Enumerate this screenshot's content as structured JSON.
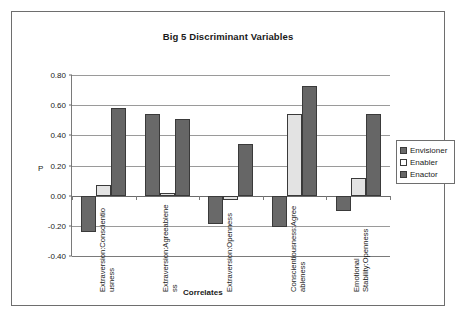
{
  "chart_data": {
    "type": "bar",
    "title": "Big 5 Discriminant Variables",
    "xlabel": "Correlates",
    "ylabel": "P",
    "ylim": [
      -0.4,
      0.8
    ],
    "ytick_step": 0.2,
    "ytick_labels": [
      "0.80",
      "0.60",
      "0.40",
      "0.20",
      "0.00",
      "-0.20",
      "-0.40"
    ],
    "ytick_values": [
      0.8,
      0.6,
      0.4,
      0.2,
      0.0,
      -0.2,
      -0.4
    ],
    "grid": true,
    "legend_position": "right",
    "categories": [
      "Extraversion:Conscientiousness",
      "Extraversion:Agreeableness",
      "Extraversion:Openness",
      "Conscientiousness:Agreeableness",
      "Emotional Stability:Openness"
    ],
    "category_label_lines": [
      [
        "Extraversion:Conscientio",
        "usness"
      ],
      [
        "Extraversion:Agreeablene",
        "ss"
      ],
      [
        "Extraversion:Openness"
      ],
      [
        "Conscientiousness:Agree",
        "ableness"
      ],
      [
        "Emotional",
        "Stability:Openness"
      ]
    ],
    "series": [
      {
        "name": "Envisioner",
        "color": "#696969",
        "values": [
          -0.24,
          0.54,
          -0.19,
          -0.21,
          -0.1
        ]
      },
      {
        "name": "Enabler",
        "color": "#e3e3e3",
        "values": [
          0.07,
          0.02,
          -0.03,
          0.54,
          0.12
        ]
      },
      {
        "name": "Enactor",
        "color": "#666666",
        "values": [
          0.58,
          0.51,
          0.34,
          0.73,
          0.54
        ]
      }
    ]
  },
  "legend": {
    "items": [
      {
        "label": "Envisioner"
      },
      {
        "label": "Enabler"
      },
      {
        "label": "Enactor"
      }
    ]
  }
}
